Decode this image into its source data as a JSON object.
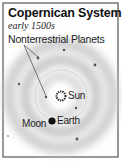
{
  "title": "Copernican System",
  "subtitle": "early 1500s",
  "labels": {
    "nonterrestrial": "Nonterrestrial Planets",
    "sun": "Sun",
    "earth": "Earth",
    "moon": "Moon"
  },
  "colors": {
    "border": "#555555",
    "band": "#b8b8b8",
    "dot": "#555555",
    "sun": "#222222",
    "earth": "#111111"
  }
}
